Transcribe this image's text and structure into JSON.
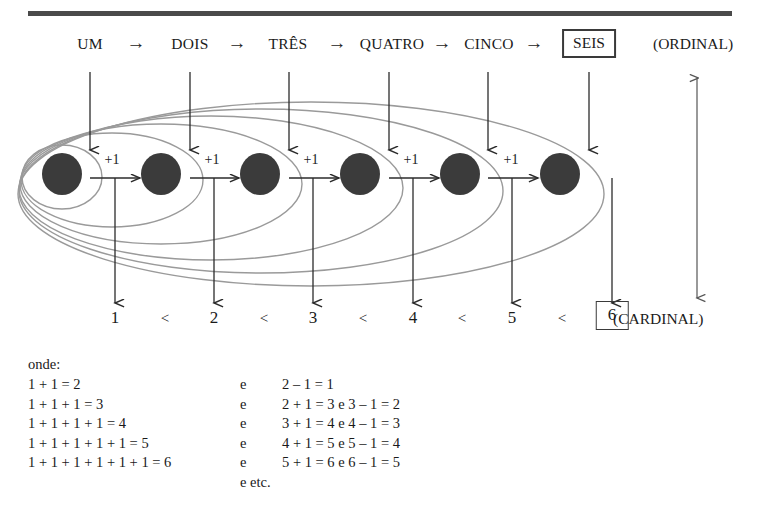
{
  "figure": {
    "title_rule": "horizontal-rule",
    "ordinal": {
      "tag": "(ORDINAL)",
      "arrow_glyph": "→",
      "words": [
        "UM",
        "DOIS",
        "TRÊS",
        "QUATRO",
        "CINCO",
        "SEIS"
      ],
      "highlighted_word": "SEIS"
    },
    "cardinal": {
      "tag": "(CARDINAL)",
      "numbers": [
        "1",
        "2",
        "3",
        "4",
        "5",
        "6"
      ],
      "relation": "<",
      "highlighted_number": "6"
    },
    "steps": {
      "increment_label": "+1",
      "count": 5
    },
    "nodes": {
      "count": 6,
      "dot_color": "#3b3b3b",
      "ellipse_color": "#8a8a8a"
    },
    "side_arrow": {
      "name": "vertical-double-arrow",
      "top_glyph": "↑",
      "bottom_glyph": "↓"
    }
  },
  "notes": {
    "heading": "onde:",
    "conjunction": "e",
    "lines": [
      {
        "left": "1 + 1 = 2",
        "mid": "e",
        "right": "2 – 1 = 1"
      },
      {
        "left": "1 + 1 + 1 = 3",
        "mid": "e",
        "right": "2 + 1 = 3 e 3 – 1 = 2"
      },
      {
        "left": "1 + 1 + 1 + 1 = 4",
        "mid": "e",
        "right": "3 + 1 = 4 e 4 – 1 = 3"
      },
      {
        "left": "1 + 1 + 1 + 1 + 1 = 5",
        "mid": "e",
        "right": "4 + 1 = 5 e 5 – 1 = 4"
      },
      {
        "left": "1 + 1 + 1 + 1 + 1 + 1 = 6",
        "mid": "e",
        "right": "5 + 1 = 6 e 6 – 1 = 5"
      }
    ],
    "etc": "e etc."
  }
}
